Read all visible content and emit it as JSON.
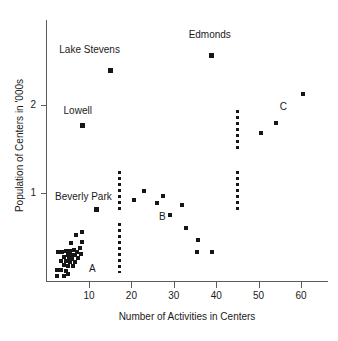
{
  "chart_data": {
    "type": "scatter",
    "title": "",
    "xlabel": "Number of Activities in Centers",
    "ylabel": "Population of Centers in '000s",
    "xlim": [
      0,
      66
    ],
    "ylim": [
      0,
      2.95
    ],
    "grid": false,
    "legend": "none",
    "xticks": [
      10,
      20,
      30,
      40,
      50,
      60
    ],
    "yticks": [
      1,
      2
    ],
    "xtick_labels": [
      "10",
      "20",
      "30",
      "40",
      "50",
      "60"
    ],
    "ytick_labels": [
      "1",
      "2"
    ],
    "points": [
      {
        "x": 39.0,
        "y": 2.55,
        "label": "Edmonds"
      },
      {
        "x": 15.0,
        "y": 2.38,
        "label": "Lake Stevens"
      },
      {
        "x": 60.5,
        "y": 2.12,
        "label": ""
      },
      {
        "x": 54.0,
        "y": 1.79,
        "label": ""
      },
      {
        "x": 8.5,
        "y": 1.76,
        "label": "Lowell"
      },
      {
        "x": 50.5,
        "y": 1.68,
        "label": ""
      },
      {
        "x": 23.0,
        "y": 1.02,
        "label": ""
      },
      {
        "x": 27.5,
        "y": 0.97,
        "label": ""
      },
      {
        "x": 20.5,
        "y": 0.92,
        "label": ""
      },
      {
        "x": 26.0,
        "y": 0.89,
        "label": ""
      },
      {
        "x": 32.0,
        "y": 0.87,
        "label": ""
      },
      {
        "x": 11.8,
        "y": 0.81,
        "label": "Beverly Park"
      },
      {
        "x": 29.2,
        "y": 0.75,
        "label": ""
      },
      {
        "x": 32.8,
        "y": 0.61,
        "label": ""
      },
      {
        "x": 35.8,
        "y": 0.47,
        "label": ""
      },
      {
        "x": 35.5,
        "y": 0.33,
        "label": ""
      },
      {
        "x": 39.0,
        "y": 0.33,
        "label": ""
      },
      {
        "x": 8.3,
        "y": 0.56,
        "label": ""
      },
      {
        "x": 7.0,
        "y": 0.52,
        "label": ""
      },
      {
        "x": 8.4,
        "y": 0.45,
        "label": ""
      },
      {
        "x": 5.8,
        "y": 0.43,
        "label": ""
      },
      {
        "x": 7.8,
        "y": 0.38,
        "label": ""
      },
      {
        "x": 2.6,
        "y": 0.33,
        "label": ""
      },
      {
        "x": 3.6,
        "y": 0.33,
        "label": ""
      },
      {
        "x": 4.6,
        "y": 0.345,
        "label": ""
      },
      {
        "x": 5.5,
        "y": 0.35,
        "label": ""
      },
      {
        "x": 6.4,
        "y": 0.355,
        "label": ""
      },
      {
        "x": 7.2,
        "y": 0.33,
        "label": ""
      },
      {
        "x": 8.1,
        "y": 0.315,
        "label": ""
      },
      {
        "x": 5.0,
        "y": 0.3,
        "label": ""
      },
      {
        "x": 5.9,
        "y": 0.3,
        "label": ""
      },
      {
        "x": 6.7,
        "y": 0.295,
        "label": ""
      },
      {
        "x": 4.2,
        "y": 0.275,
        "label": ""
      },
      {
        "x": 5.2,
        "y": 0.26,
        "label": ""
      },
      {
        "x": 6.1,
        "y": 0.255,
        "label": ""
      },
      {
        "x": 7.4,
        "y": 0.26,
        "label": ""
      },
      {
        "x": 3.4,
        "y": 0.235,
        "label": ""
      },
      {
        "x": 4.5,
        "y": 0.23,
        "label": ""
      },
      {
        "x": 5.6,
        "y": 0.22,
        "label": ""
      },
      {
        "x": 6.6,
        "y": 0.215,
        "label": ""
      },
      {
        "x": 4.0,
        "y": 0.185,
        "label": ""
      },
      {
        "x": 5.0,
        "y": 0.175,
        "label": ""
      },
      {
        "x": 6.2,
        "y": 0.17,
        "label": ""
      },
      {
        "x": 2.4,
        "y": 0.13,
        "label": ""
      },
      {
        "x": 3.5,
        "y": 0.125,
        "label": ""
      },
      {
        "x": 4.6,
        "y": 0.12,
        "label": ""
      },
      {
        "x": 2.5,
        "y": 0.06,
        "label": ""
      },
      {
        "x": 4.0,
        "y": 0.06,
        "label": ""
      },
      {
        "x": 5.1,
        "y": 0.08,
        "label": ""
      }
    ],
    "point_labels": [
      {
        "text": "Edmonds",
        "x": 33.5,
        "y": 2.78,
        "anchor": "start"
      },
      {
        "text": "Lake Stevens",
        "x": 3.0,
        "y": 2.62,
        "anchor": "start"
      },
      {
        "text": "Lowell",
        "x": 4.0,
        "y": 1.93,
        "anchor": "start"
      },
      {
        "text": "Beverly Park",
        "x": 2.0,
        "y": 0.95,
        "anchor": "start"
      }
    ],
    "group_labels": [
      {
        "text": "A",
        "x": 10.0,
        "y": 0.14
      },
      {
        "text": "B",
        "x": 26.5,
        "y": 0.73
      },
      {
        "text": "C",
        "x": 55.0,
        "y": 1.97
      }
    ],
    "dashed_lines": [
      {
        "x": 17.3,
        "y0": 0.1,
        "y1": 0.66
      },
      {
        "x": 17.3,
        "y0": 0.8,
        "y1": 1.25
      },
      {
        "x": 45.0,
        "y0": 0.8,
        "y1": 1.25
      },
      {
        "x": 45.0,
        "y0": 1.48,
        "y1": 1.94
      }
    ],
    "colors": {
      "marker": "#161616",
      "axis": "#5b5b5b",
      "text": "#1a1a1a",
      "background": "#ffffff"
    }
  }
}
